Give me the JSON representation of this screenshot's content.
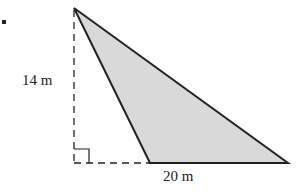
{
  "figure": {
    "height_label": "14 m",
    "base_label": "20 m",
    "colors": {
      "stroke": "#222222",
      "fill": "#d9d9d9"
    }
  }
}
